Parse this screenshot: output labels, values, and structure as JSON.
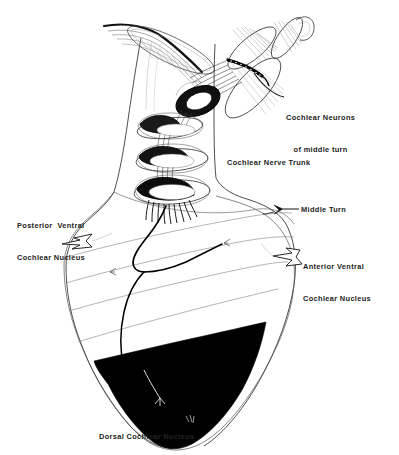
{
  "figure": {
    "background_color": "#ffffff",
    "ink_color": "#000000",
    "text_color": "#232323",
    "width": 399,
    "height": 455
  },
  "labels": {
    "cochlear_neurons_line1": "Cochlear Neurons",
    "cochlear_neurons_line2": "of middle turn",
    "cochlear_nerve_trunk": "Cochlear Nerve Trunk",
    "posterior_ventral_line1": "Posterior  Ventral",
    "posterior_ventral_line2": "Cochlear Nucleus",
    "middle_turn": "Middle Turn",
    "anterior_ventral_line1": "Anterior Ventral",
    "anterior_ventral_line2": "Cochlear Nucleus",
    "dorsal_cochlear_nucleus": "Dorsal Cochlear Nucleus"
  },
  "structures": {
    "cochlear_turns_count": 4,
    "stripe_lines_count": 4,
    "dark_region_name": "dorsal-cochlear-nucleus-shaded",
    "dark_region_fill": "#000000",
    "pointer_arrows": [
      {
        "name": "posterior-ventral-arrow",
        "style": "hollow-outline",
        "direction": "left"
      },
      {
        "name": "anterior-ventral-arrow",
        "style": "hollow-outline",
        "direction": "left"
      },
      {
        "name": "middle-turn-arrow",
        "style": "solid-small",
        "direction": "left"
      }
    ],
    "leader_lines": [
      {
        "name": "cochlear-neurons-leader"
      },
      {
        "name": "middle-turn-leader"
      }
    ]
  }
}
